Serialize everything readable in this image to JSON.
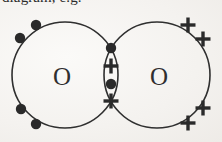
{
  "page": {
    "width": 222,
    "height": 142,
    "background_color": "#f6f4f1",
    "ink_color": "#2a2a2a"
  },
  "header": {
    "text": "diagram, e.g.",
    "clipped_at_top": true
  },
  "diagram": {
    "molecule": "O2",
    "type": "dot-and-cross",
    "left_atom": {
      "label": "O",
      "label_x": 62,
      "label_y": 76,
      "circle": {
        "cx": 65,
        "cy": 75,
        "r": 53
      },
      "electron_symbol": "dot",
      "outer_electrons": [
        {
          "symbol": "dot",
          "x": 36,
          "y": 25
        },
        {
          "symbol": "dot",
          "x": 20,
          "y": 38
        },
        {
          "symbol": "dot",
          "x": 21,
          "y": 109
        },
        {
          "symbol": "dot",
          "x": 36,
          "y": 124
        }
      ]
    },
    "right_atom": {
      "label": "O",
      "label_x": 159,
      "label_y": 76,
      "circle": {
        "cx": 157,
        "cy": 75,
        "r": 53
      },
      "electron_symbol": "cross",
      "outer_electrons": [
        {
          "symbol": "cross",
          "x": 188,
          "y": 25
        },
        {
          "symbol": "cross",
          "x": 203,
          "y": 39
        },
        {
          "symbol": "cross",
          "x": 203,
          "y": 108
        },
        {
          "symbol": "cross",
          "x": 188,
          "y": 123
        }
      ]
    },
    "shared_region": {
      "name": "overlap-lens",
      "center_x": 111,
      "electrons": [
        {
          "symbol": "dot",
          "x": 111,
          "y": 48
        },
        {
          "symbol": "cross",
          "x": 111,
          "y": 66
        },
        {
          "symbol": "dot",
          "x": 111,
          "y": 84
        },
        {
          "symbol": "cross",
          "x": 111,
          "y": 101
        }
      ]
    },
    "stroke_width": 1.6,
    "dot_radius": 5.2,
    "cross_arm": 7.5,
    "cross_thickness": 3.4
  }
}
